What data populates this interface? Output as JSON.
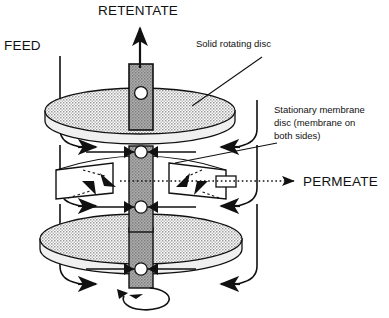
{
  "figure": {
    "title_none": "",
    "labels": {
      "retentate": "RETENTATE",
      "feed": "FEED",
      "permeate": "PERMEATE",
      "solid_rotating_disc": "Solid rotating disc",
      "stationary_membrane_line1": "Stationary membrane",
      "stationary_membrane_line2": "disc (membrane on",
      "stationary_membrane_line3": "both sides)"
    },
    "colors": {
      "outline": "#1a1a1a",
      "disc_fill": "#c9c9c9",
      "disc_edge_fill": "#f2f2f2",
      "shaft_fill": "#9e9e9e",
      "background": "#ffffff",
      "text": "#111111"
    },
    "components": {
      "top_disc": "solid rotating disc (upper)",
      "bottom_disc": "solid rotating disc (lower)",
      "membrane_disc": "stationary membrane disc",
      "shaft": "central rotating shaft",
      "bearing_upper": "upper bearing",
      "bearing_lower": "lower bearing",
      "permeate_outlet": "permeate outlet port",
      "rotation_arrow": "shaft rotation arrow"
    },
    "flow": {
      "feed_arrows_left": 3,
      "feed_arrows_right": 3,
      "retentate_arrows": 1,
      "permeate_arrows": 1,
      "membrane_flux_arrows": 4
    }
  }
}
